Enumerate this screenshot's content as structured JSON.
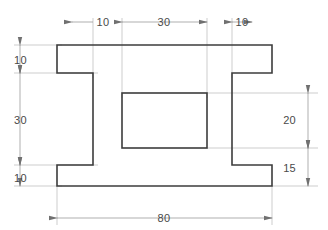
{
  "drawing": {
    "title": "Orthographic front view of a symmetric H-profile bracket",
    "type": "engineering-technical-drawing",
    "units": "mm",
    "colors": {
      "background": "#ffffff",
      "outline": "#3c3c3c",
      "dimension_line": "#9a9a9a",
      "extension_line": "#b4b4b4",
      "text": "#4a4a4a"
    },
    "line_weights": {
      "outline": 1.6,
      "dimension": 0.7,
      "extension": 0.7
    },
    "dimensions": {
      "top": [
        {
          "id": "top-left-10",
          "value": "10",
          "span": 10
        },
        {
          "id": "top-center-30",
          "value": "30",
          "span": 30
        },
        {
          "id": "top-right-10",
          "value": "10",
          "span": 10
        }
      ],
      "left": [
        {
          "id": "left-top-10",
          "value": "10",
          "span": 10
        },
        {
          "id": "left-middle-30",
          "value": "30",
          "span": 30
        },
        {
          "id": "left-bottom-10",
          "value": "10",
          "span": 10
        }
      ],
      "right": [
        {
          "id": "right-upper-20",
          "value": "20",
          "span": 20
        },
        {
          "id": "right-lower-15",
          "value": "15",
          "span": 15
        }
      ],
      "bottom": [
        {
          "id": "bottom-overall-80",
          "value": "80",
          "span": 80
        }
      ]
    },
    "geometry": {
      "overall_width": 80,
      "overall_height": 50,
      "outer_profile_points": "57,45 272,45 272,73 232,73 232,165 272,165 272,186 57,186 57,165 93,165 93,73 57,73",
      "inner_cutout": {
        "x": 122,
        "y": 93,
        "width": 85,
        "height": 55
      }
    }
  }
}
